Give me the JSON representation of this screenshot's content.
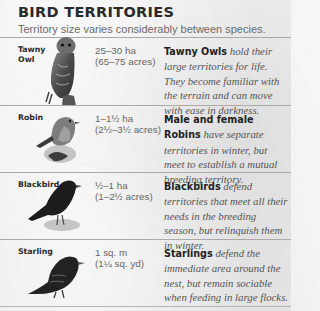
{
  "header": {
    "title": "BIRD TERRITORIES",
    "subtitle": "Territory size varies considerably between species."
  },
  "birds": [
    {
      "name_line1": "Tawny",
      "name_line2": "Owl",
      "size_metric": "25–30 ha",
      "size_imperial": "(65–75 acres)",
      "desc_lead": "Tawny Owls",
      "desc_text": " hold their large territories for life. They become familiar with the terrain and can move with ease in darkness.",
      "icon": "owl-illustration"
    },
    {
      "name_line1": "Robin",
      "name_line2": "",
      "size_metric": "1–1½ ha",
      "size_imperial": "(2½–3½ acres)",
      "desc_lead": "Male and female Robins",
      "desc_text": " have separate territories in winter, but meet to establish a mutual breeding territory.",
      "icon": "robin-illustration"
    },
    {
      "name_line1": "Blackbird",
      "name_line2": "",
      "size_metric": "½–1 ha",
      "size_imperial": "(1–2½ acres)",
      "desc_lead": "Blackbirds",
      "desc_text": " defend territories that meet all their needs in the breeding season, but relinquish them in winter.",
      "icon": "blackbird-illustration"
    },
    {
      "name_line1": "Starling",
      "name_line2": "",
      "size_metric": "1 sq. m",
      "size_imperial": "(1¼ sq. yd)",
      "desc_lead": "Starlings",
      "desc_text": " defend the immediate area around the nest, but remain sociable when feeding in large flocks.",
      "icon": "starling-illustration"
    }
  ]
}
